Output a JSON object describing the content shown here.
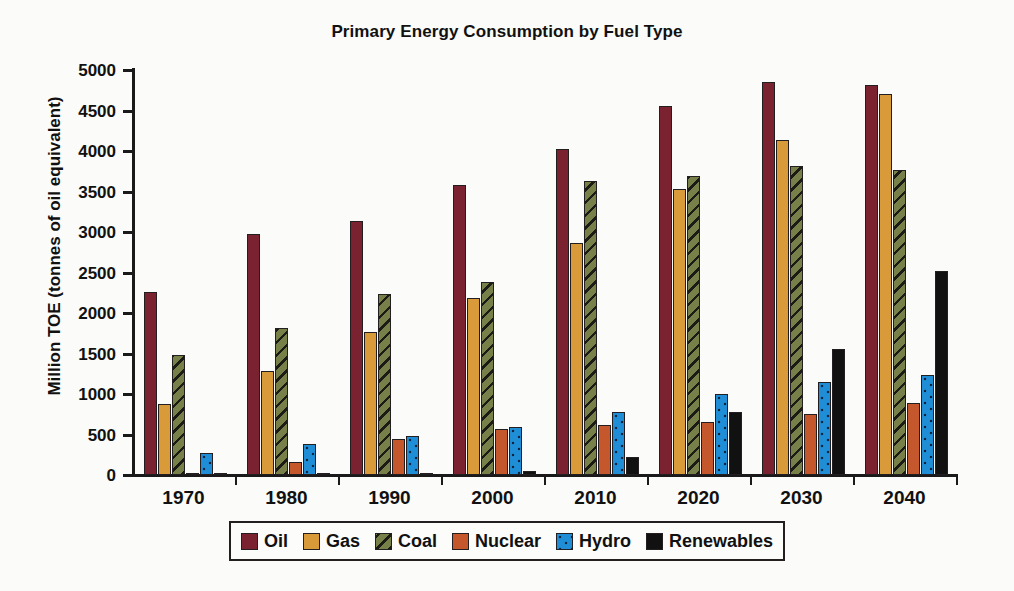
{
  "chart_data": {
    "type": "bar",
    "title": "Primary Energy Consumption by Fuel Type",
    "xlabel": "",
    "ylabel": "Million TOE (tonnes of oil equivalent)",
    "ylim": [
      0,
      5000
    ],
    "yticks": [
      "0",
      "500",
      "1000",
      "1500",
      "2000",
      "2500",
      "3000",
      "3500",
      "4000",
      "4500",
      "5000"
    ],
    "grid": false,
    "legend_position": "bottom",
    "categories": [
      "1970",
      "1980",
      "1990",
      "2000",
      "2010",
      "2020",
      "2030",
      "2040"
    ],
    "series": [
      {
        "name": "Oil",
        "color": "#7b2230",
        "values": [
          2260,
          2980,
          3140,
          3580,
          4020,
          4560,
          4850,
          4820
        ]
      },
      {
        "name": "Gas",
        "color": "#d99a3a",
        "values": [
          880,
          1290,
          1760,
          2190,
          2870,
          3530,
          4140,
          4700
        ]
      },
      {
        "name": "Coal",
        "color": "#78804a",
        "values": [
          1480,
          1810,
          2240,
          2380,
          3630,
          3690,
          3810,
          3760
        ]
      },
      {
        "name": "Nuclear",
        "color": "#c4582c",
        "values": [
          20,
          160,
          450,
          570,
          620,
          660,
          750,
          890
        ]
      },
      {
        "name": "Hydro",
        "color": "#1f8ed6",
        "values": [
          270,
          380,
          480,
          590,
          780,
          1000,
          1150,
          1230
        ]
      },
      {
        "name": "Renewables",
        "color": "#111111",
        "values": [
          5,
          10,
          30,
          50,
          220,
          780,
          1550,
          2520
        ]
      }
    ]
  }
}
